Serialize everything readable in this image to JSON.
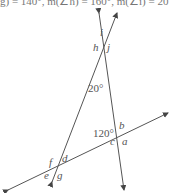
{
  "header": {
    "text": "g) = 140°, m(∠h) = 160°, m(∠i) = 20"
  },
  "diagram": {
    "angle_labels": [
      "a",
      "b",
      "c",
      "d",
      "e",
      "f",
      "g",
      "h",
      "i",
      "j"
    ],
    "given_angles": {
      "top": "20°",
      "right_vertex": "120°"
    },
    "line_color": "#444444",
    "text_color": "#555555"
  }
}
